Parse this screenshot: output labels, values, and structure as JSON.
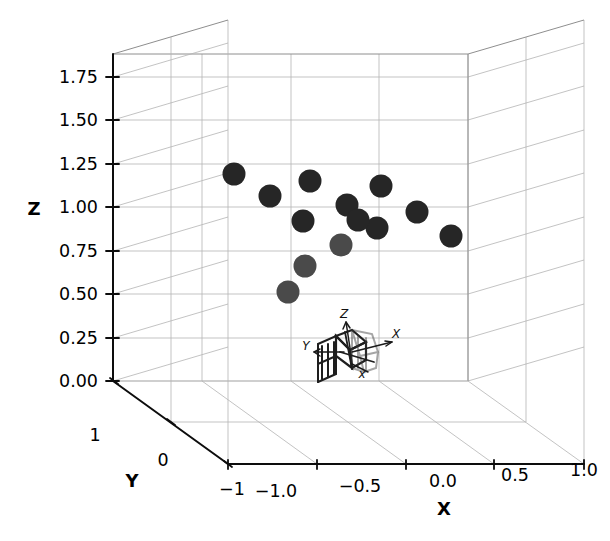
{
  "figure": {
    "background_color": "#ffffff",
    "marker_color_dark": "#262626",
    "marker_color_mid": "#4a4a4a",
    "grid_color": "#9a9a9a",
    "spine_color": "#0d0d0d"
  },
  "chart_data": {
    "type": "scatter",
    "projection": "3d",
    "title": "",
    "xlabel": "X",
    "ylabel": "Y",
    "zlabel": "Z",
    "xticklabels": [
      "−1.0",
      "−0.5",
      "0.0",
      "0.5",
      "1.0"
    ],
    "yticklabels": [
      "1",
      "0",
      "−1"
    ],
    "zticklabels": [
      "0.00",
      "0.25",
      "0.50",
      "0.75",
      "1.00",
      "1.25",
      "1.50",
      "1.75"
    ],
    "xticks": [
      -1.0,
      -0.5,
      0.0,
      0.5,
      1.0
    ],
    "yticks": [
      1,
      0,
      -1
    ],
    "zticks": [
      0.0,
      0.25,
      0.5,
      0.75,
      1.0,
      1.25,
      1.5,
      1.75
    ],
    "xlim": [
      -1.0,
      1.0
    ],
    "ylim": [
      1,
      -1
    ],
    "zlim": [
      0.0,
      1.875
    ],
    "grid": true,
    "legend": "none",
    "n_points": 13,
    "points": [
      {
        "px": 234,
        "py": 174,
        "z": 1.08,
        "shade": "dark",
        "r": 11.5
      },
      {
        "px": 270,
        "py": 196,
        "z": 0.94,
        "shade": "dark",
        "r": 11.5
      },
      {
        "px": 310,
        "py": 181,
        "z": 1.04,
        "shade": "dark",
        "r": 11.5
      },
      {
        "px": 381,
        "py": 186,
        "z": 0.99,
        "shade": "dark",
        "r": 11.5
      },
      {
        "px": 303,
        "py": 221,
        "z": 0.78,
        "shade": "dark",
        "r": 11.5
      },
      {
        "px": 347,
        "py": 205,
        "z": 0.88,
        "shade": "dark",
        "r": 11.5
      },
      {
        "px": 417,
        "py": 212,
        "z": 0.83,
        "shade": "dark",
        "r": 11.5
      },
      {
        "px": 377,
        "py": 228,
        "z": 0.73,
        "shade": "dark",
        "r": 11.5
      },
      {
        "px": 451,
        "py": 236,
        "z": 0.68,
        "shade": "dark",
        "r": 11.5
      },
      {
        "px": 341,
        "py": 245,
        "z": 0.64,
        "shade": "mid",
        "r": 11.5
      },
      {
        "px": 305,
        "py": 266,
        "z": 0.48,
        "shade": "mid",
        "r": 11.5
      },
      {
        "px": 288,
        "py": 292,
        "z": 0.33,
        "shade": "mid",
        "r": 11.5
      },
      {
        "px": 358,
        "py": 220,
        "z": 0.8,
        "shade": "dark",
        "r": 11.5
      }
    ],
    "annotations": [
      {
        "name": "gripper-frame-x-label",
        "text": "X",
        "px": 396,
        "py": 338
      },
      {
        "name": "gripper-frame-y-label",
        "text": "Y",
        "px": 306,
        "py": 350
      },
      {
        "name": "gripper-frame-z-label",
        "text": "Z",
        "px": 344,
        "py": 318
      },
      {
        "name": "gripper-frame-x-tip-label",
        "text": "x",
        "px": 362,
        "py": 375
      }
    ]
  },
  "axes": {
    "x_title": "X",
    "y_title": "Y",
    "z_title": "Z"
  }
}
